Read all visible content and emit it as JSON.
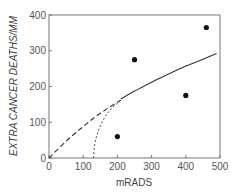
{
  "chart_data": {
    "type": "scatter",
    "title": "",
    "xlabel": "mRADS",
    "ylabel": "EXTRA CANCER DEATHS/MM",
    "xlim": [
      0,
      500
    ],
    "ylim": [
      0,
      400
    ],
    "x_ticks": [
      "0",
      "100",
      "200",
      "300",
      "400",
      "500"
    ],
    "y_ticks": [
      "0",
      "100",
      "200",
      "300",
      "400"
    ],
    "grid": false,
    "legend": null,
    "series": [
      {
        "name": "observed points",
        "kind": "scatter",
        "x": [
          200,
          250,
          400,
          460
        ],
        "y": [
          60,
          275,
          175,
          365
        ]
      },
      {
        "name": "fitted curve (solid)",
        "kind": "line-solid",
        "x": [
          210,
          250,
          300,
          350,
          400,
          450,
          490
        ],
        "y": [
          165,
          187,
          212,
          235,
          257,
          276,
          292
        ]
      },
      {
        "name": "linear extrapolation (dashed)",
        "kind": "line-dashed",
        "x": [
          0,
          50,
          100,
          150,
          210
        ],
        "y": [
          0,
          47,
          88,
          125,
          162
        ]
      },
      {
        "name": "threshold curve (dotted)",
        "kind": "line-dotted",
        "x": [
          130,
          135,
          150,
          175,
          210
        ],
        "y": [
          0,
          45,
          90,
          130,
          162
        ]
      }
    ]
  }
}
